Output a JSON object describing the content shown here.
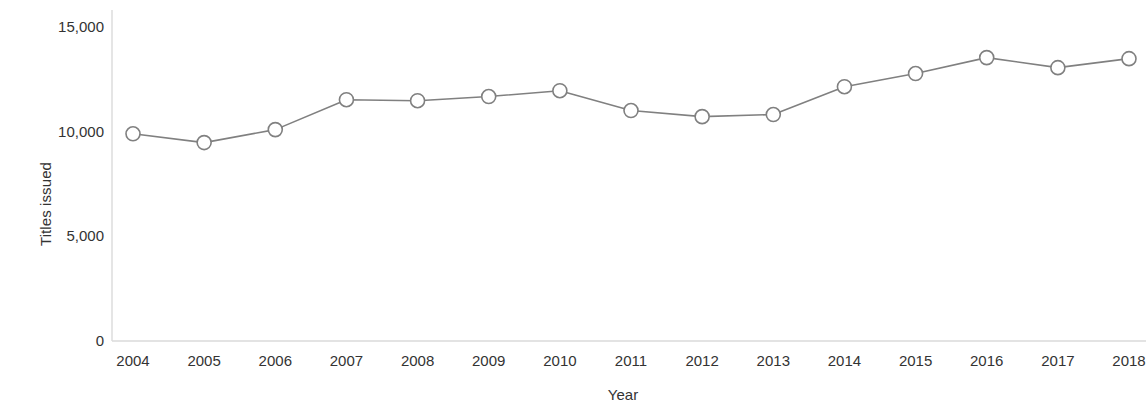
{
  "chart_data": {
    "type": "line",
    "title": "",
    "xlabel": "Year",
    "ylabel": "Titles issued",
    "categories": [
      "2004",
      "2005",
      "2006",
      "2007",
      "2008",
      "2009",
      "2010",
      "2011",
      "2012",
      "2013",
      "2014",
      "2015",
      "2016",
      "2017",
      "2018"
    ],
    "x": [
      2004,
      2005,
      2006,
      2007,
      2008,
      2009,
      2010,
      2011,
      2012,
      2013,
      2014,
      2015,
      2016,
      2017,
      2018
    ],
    "values": [
      9850,
      9430,
      10050,
      11480,
      11430,
      11630,
      11910,
      10960,
      10670,
      10770,
      12100,
      12730,
      13490,
      13010,
      13440
    ],
    "series": [
      {
        "name": "Titles issued",
        "values": [
          9850,
          9430,
          10050,
          11480,
          11430,
          11630,
          11910,
          10960,
          10670,
          10770,
          12100,
          12730,
          13490,
          13010,
          13440
        ]
      }
    ],
    "ylim": [
      0,
      15000
    ],
    "xlim": [
      2004,
      2018
    ],
    "y_ticks": [
      0,
      5000,
      10000,
      15000
    ],
    "y_tick_labels": [
      "0",
      "5,000",
      "10,000",
      "15,000"
    ],
    "x_tick_labels": [
      "2004",
      "2005",
      "2006",
      "2007",
      "2008",
      "2009",
      "2010",
      "2011",
      "2012",
      "2013",
      "2014",
      "2015",
      "2016",
      "2017",
      "2018"
    ],
    "grid": false,
    "legend": "none",
    "line_color": "#808080",
    "marker_color": "#808080",
    "marker_fill": "#ffffff",
    "axis_color": "#d8d8d8",
    "text_color": "#333333"
  }
}
